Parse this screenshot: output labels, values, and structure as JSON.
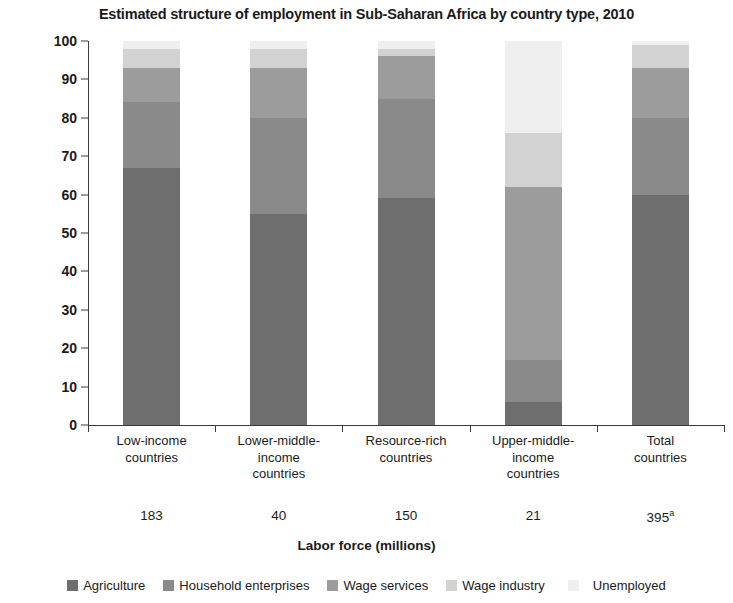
{
  "chart_data": {
    "type": "bar",
    "subtype": "stacked-percent",
    "title": "Estimated structure of employment in Sub-Saharan Africa by country type, 2010",
    "xlabel": "Labor force (millions)",
    "ylabel": "% of total",
    "ylim": [
      0,
      100
    ],
    "yticks": [
      0,
      10,
      20,
      30,
      40,
      50,
      60,
      70,
      80,
      90,
      100
    ],
    "grid": false,
    "legend_position": "bottom",
    "categories": [
      "Low-income\ncountries",
      "Lower-middle-\nincome\ncountries",
      "Resource-rich\ncountries",
      "Upper-middle-\nincome\ncountries",
      "Total\ncountries"
    ],
    "category_lines": [
      [
        "Low-income",
        "countries"
      ],
      [
        "Lower-middle-",
        "income",
        "countries"
      ],
      [
        "Resource-rich",
        "countries"
      ],
      [
        "Upper-middle-",
        "income",
        "countries"
      ],
      [
        "Total",
        "countries"
      ]
    ],
    "labor_force": [
      "183",
      "40",
      "150",
      "21",
      "395"
    ],
    "labor_force_superscripts": [
      "",
      "",
      "",
      "",
      "a"
    ],
    "series": [
      {
        "name": "Agriculture",
        "color": "#6e6e6e",
        "values": [
          67,
          55,
          59,
          6,
          60
        ]
      },
      {
        "name": "Household enterprises",
        "color": "#8a8a8a",
        "values": [
          17,
          25,
          26,
          11,
          20
        ]
      },
      {
        "name": "Wage services",
        "color": "#9c9c9c",
        "values": [
          9,
          13,
          11,
          45,
          13
        ]
      },
      {
        "name": "Wage industry",
        "color": "#d2d2d2",
        "values": [
          5,
          5,
          2,
          14,
          6
        ]
      },
      {
        "name": "Unemployed",
        "color": "#efefef",
        "values": [
          2,
          2,
          2,
          24,
          1
        ]
      }
    ]
  },
  "legend": {
    "items": [
      {
        "label": "Agriculture",
        "color": "#6e6e6e"
      },
      {
        "label": "Household enterprises",
        "color": "#8a8a8a"
      },
      {
        "label": "Wage services",
        "color": "#9c9c9c"
      },
      {
        "label": "Wage industry",
        "color": "#d2d2d2"
      },
      {
        "label": "Unemployed",
        "color": "#efefef"
      }
    ]
  }
}
